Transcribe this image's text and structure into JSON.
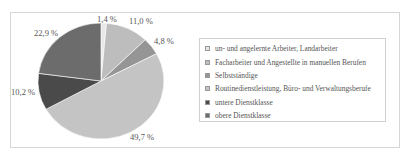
{
  "chart_data": {
    "type": "pie",
    "title": "",
    "categories": [
      "un- und angelernte Arbeiter, Landarbeiter",
      "Facharbeiter und Angestellte in manuellen Berufen",
      "Selbstständige",
      "Routinedienstleistung, Büro- und Verwaltungsberufe",
      "untere Dienstklasse",
      "obere Dienstklasse"
    ],
    "values": [
      1.4,
      11.0,
      4.8,
      49.7,
      10.2,
      22.9
    ],
    "labels": [
      "1,4 %",
      "11,0 %",
      "4,8 %",
      "49,7 %",
      "10,2 %",
      "22,9 %"
    ],
    "colors": [
      "#e8e8e8",
      "#bdbdbd",
      "#959595",
      "#c4c4c4",
      "#4a4a4a",
      "#6c6c6c"
    ],
    "start_angle": "12 o'clock",
    "direction": "clockwise",
    "legend_position": "right"
  },
  "legend": {
    "items": [
      {
        "label": "un- und angelernte Arbeiter, Landarbeiter",
        "color": "#e8e8e8"
      },
      {
        "label": "Facharbeiter und Angestellte in manuellen Berufen",
        "color": "#bdbdbd"
      },
      {
        "label": "Selbstständige",
        "color": "#959595"
      },
      {
        "label": "Routinedienstleistung, Büro- und Verwaltungsberufe",
        "color": "#c4c4c4"
      },
      {
        "label": "untere Dienstklasse",
        "color": "#4a4a4a"
      },
      {
        "label": "obere Dienstklasse",
        "color": "#6c6c6c"
      }
    ]
  },
  "slice_labels": {
    "s0": "1,4 %",
    "s1": "11,0 %",
    "s2": "4,8 %",
    "s3": "49,7 %",
    "s4": "10,2 %",
    "s5": "22,9 %"
  }
}
